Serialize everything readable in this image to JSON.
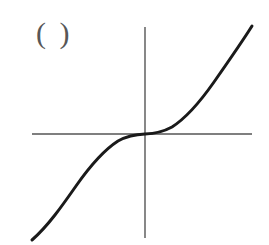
{
  "figure": {
    "label": "( )",
    "label_color": "#575757",
    "background_color": "#ffffff",
    "width": 269,
    "height": 245
  },
  "axes": {
    "color": "#555555",
    "stroke_width": 1.4,
    "origin_px": {
      "x": 145,
      "y": 134
    },
    "x_axis": {
      "name": "horizontal-axis",
      "x_start_px": 32,
      "x_end_px": 252,
      "y_px": 134
    },
    "y_axis": {
      "name": "vertical-axis",
      "y_start_px": 27,
      "y_end_px": 238,
      "x_px": 145
    }
  },
  "chart_data": {
    "type": "line",
    "title": "",
    "subtitle": "",
    "xlabel": "",
    "ylabel": "",
    "annotations": [
      "( )"
    ],
    "legend": [],
    "legend_position": "none",
    "grid": false,
    "axis_ticks": false,
    "tick_labels": [],
    "xlim": [
      -1.15,
      1.1
    ],
    "ylim": [
      -1.1,
      1.12
    ],
    "series": [
      {
        "name": "y = x^3",
        "color": "#1a1a1a",
        "stroke_width": 3,
        "x": [
          -1.15,
          -1.05,
          -0.95,
          -0.85,
          -0.75,
          -0.65,
          -0.55,
          -0.45,
          -0.35,
          -0.25,
          -0.15,
          -0.05,
          0,
          0.05,
          0.15,
          0.25,
          0.35,
          0.45,
          0.55,
          0.65,
          0.75,
          0.85,
          0.95,
          1.05,
          1.1
        ],
        "y": [
          -1.521,
          -1.158,
          -0.857,
          -0.614,
          -0.422,
          -0.275,
          -0.166,
          -0.091,
          -0.043,
          -0.016,
          -0.003,
          0,
          0,
          0,
          0.003,
          0.016,
          0.043,
          0.091,
          0.166,
          0.275,
          0.422,
          0.614,
          0.857,
          1.158,
          1.331
        ],
        "path_px": "M 32,240 C 48,226 62,206 76,186 C 90,166 104,150 118,141 C 128,135.5 137,134.3 145,134 C 153,133.7 162,132.5 172,127 C 186,118 200,102 214,82 C 228,62 242,42 252,26"
      }
    ]
  }
}
